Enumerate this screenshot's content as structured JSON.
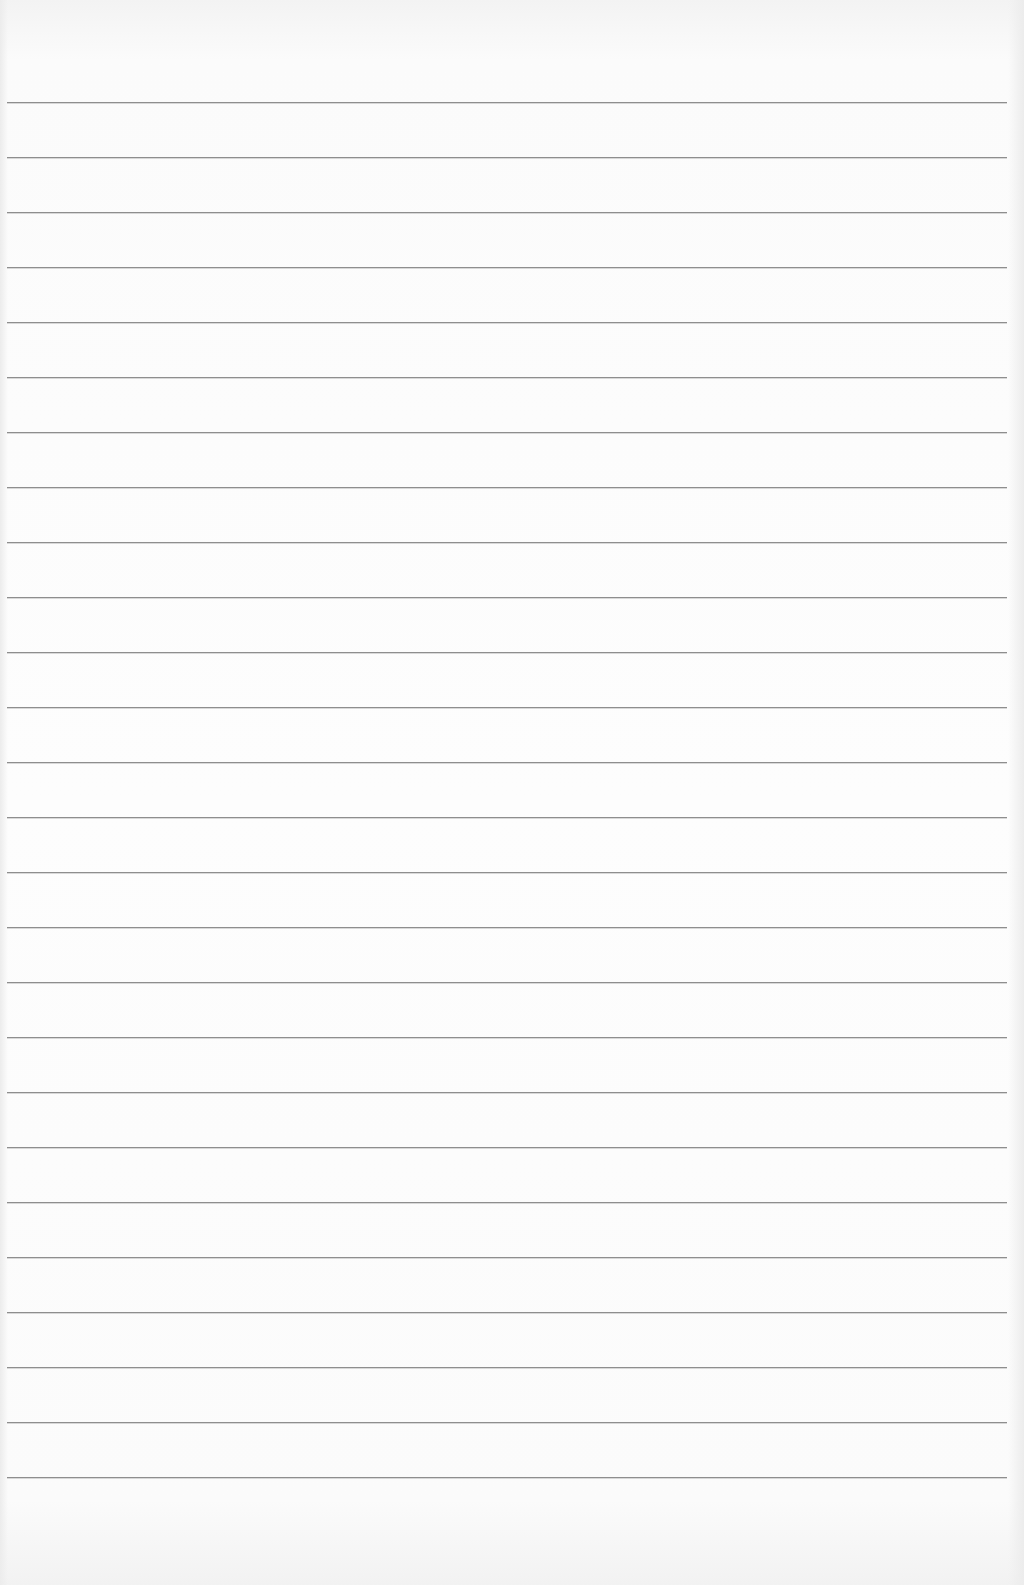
{
  "page": {
    "type": "blank lined paper",
    "background_color": "#fbfbfb",
    "line_color": "#8e8e8e",
    "line_count": 26,
    "first_line_y": 102,
    "line_spacing": 55,
    "line_left": 7,
    "line_width": 1000
  }
}
